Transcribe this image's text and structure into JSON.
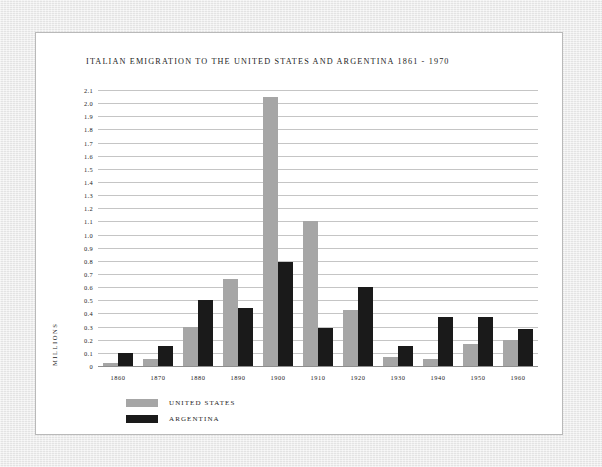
{
  "card": {
    "background": "#ffffff",
    "border_color": "#b9b9b9"
  },
  "page": {
    "background": "#e9e9e9"
  },
  "chart_data": {
    "type": "bar",
    "title": "ITALIAN EMIGRATION TO THE UNITED STATES AND ARGENTINA 1861 - 1970",
    "xlabel": "",
    "ylabel": "MILLIONS",
    "ylim": [
      0,
      2.1
    ],
    "ytick_step": 0.1,
    "grid": true,
    "legend_position": "bottom-left",
    "categories": [
      "1860",
      "1870",
      "1880",
      "1890",
      "1900",
      "1910",
      "1920",
      "1930",
      "1940",
      "1950",
      "1960"
    ],
    "ytick_labels": [
      "2.1",
      "2.0",
      "1.9",
      "1.8",
      "1.7",
      "1.6",
      "1.5",
      "1.4",
      "1.3",
      "1.2",
      "1.1",
      "1.0",
      "0.9",
      "0.8",
      "0.7",
      "0.6",
      "0.5",
      "0.4",
      "0.3",
      "0.2",
      "0.1",
      "0"
    ],
    "series": [
      {
        "name": "UNITED STATES",
        "color": "#a6a6a6",
        "values": [
          0.02,
          0.05,
          0.3,
          0.66,
          2.05,
          1.1,
          0.43,
          0.07,
          0.05,
          0.17,
          0.2
        ]
      },
      {
        "name": "ARGENTINA",
        "color": "#1a1a1a",
        "values": [
          0.1,
          0.15,
          0.5,
          0.44,
          0.79,
          0.29,
          0.6,
          0.15,
          0.37,
          0.375,
          0.285
        ]
      }
    ]
  }
}
